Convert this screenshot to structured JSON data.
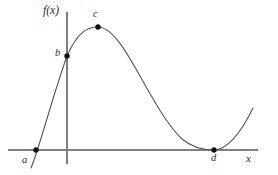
{
  "figure": {
    "title": "",
    "kind": "function-graph",
    "width": 278,
    "height": 175,
    "background_color": "#ffffff"
  },
  "axes": {
    "x_axis": {
      "label": "x",
      "icon": "horizontal-axis-line",
      "color": "#808080",
      "y_pixel": 150,
      "x_start_pixel": 8,
      "x_end_pixel": 258
    },
    "y_axis": {
      "label": "f(x)",
      "icon": "vertical-axis-line",
      "color": "#808080",
      "x_pixel": 67,
      "y_start_pixel": 12,
      "y_end_pixel": 164
    }
  },
  "curve": {
    "name": "f",
    "color": "#555555",
    "stroke_width": 1
  },
  "points": [
    {
      "label": "a",
      "x_pixel": 36,
      "y_pixel": 150,
      "description": "x-intercept left of origin"
    },
    {
      "label": "b",
      "x_pixel": 67,
      "y_pixel": 56,
      "description": "y-intercept on the vertical axis"
    },
    {
      "label": "c",
      "x_pixel": 98,
      "y_pixel": 27,
      "description": "local maximum of the curve"
    },
    {
      "label": "d",
      "x_pixel": 214,
      "y_pixel": 150,
      "description": "local minimum tangent to the x-axis"
    }
  ],
  "chart_data": {
    "type": "line",
    "title": "",
    "xlabel": "x",
    "ylabel": "f(x)",
    "grid": false,
    "legend": null,
    "annotations": [
      {
        "text": "a",
        "role": "x-intercept"
      },
      {
        "text": "b",
        "role": "y-intercept"
      },
      {
        "text": "c",
        "role": "local-maximum"
      },
      {
        "text": "d",
        "role": "local-minimum-touching-axis"
      }
    ],
    "marked_points": [
      {
        "label": "a",
        "x": 36,
        "y": 150
      },
      {
        "label": "b",
        "x": 67,
        "y": 56
      },
      {
        "label": "c",
        "x": 98,
        "y": 27
      },
      {
        "label": "d",
        "x": 214,
        "y": 150
      }
    ],
    "path": "M31,168 C40,146 52,98 67,56 C78,31 88,27 98,27 C112,27 126,51 140,76 C154,101 168,126 182,139 C194,149 206,150 214,150 C226,150 240,135 253,108"
  }
}
